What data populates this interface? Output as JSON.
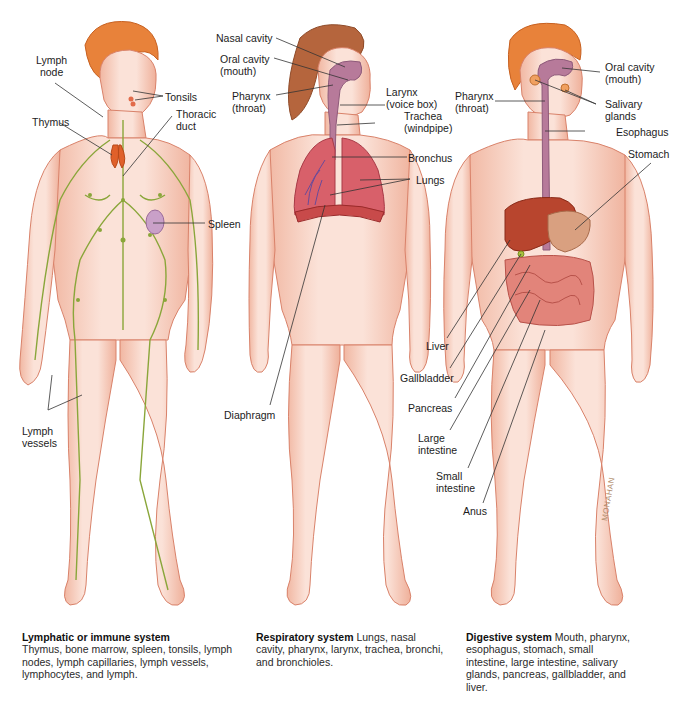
{
  "figures": {
    "lymphatic": {
      "labels": {
        "lymph_node": "Lymph\nnode",
        "tonsils": "Tonsils",
        "thymus": "Thymus",
        "thoracic_duct": "Thoracic\nduct",
        "spleen": "Spleen",
        "lymph_vessels": "Lymph\nvessels"
      },
      "caption": {
        "title": "Lymphatic or immune system",
        "body": "Thymus, bone marrow, spleen, tonsils, lymph nodes, lymph capillaries, lymph vessels, lymphocytes, and lymph."
      }
    },
    "respiratory": {
      "labels": {
        "nasal_cavity": "Nasal cavity",
        "oral_cavity": "Oral cavity\n(mouth)",
        "pharynx": "Pharynx\n(throat)",
        "larynx": "Larynx\n(voice box)",
        "trachea": "Trachea\n(windpipe)",
        "bronchus": "Bronchus",
        "lungs": "Lungs",
        "diaphragm": "Diaphragm"
      },
      "caption": {
        "title": "Respiratory system",
        "body": " Lungs, nasal cavity, pharynx, larynx, trachea, bronchi, and bronchioles."
      }
    },
    "digestive": {
      "labels": {
        "oral_cavity": "Oral cavity\n(mouth)",
        "pharynx": "Pharynx\n(throat)",
        "salivary_glands": "Salivary\nglands",
        "esophagus": "Esophagus",
        "stomach": "Stomach",
        "liver": "Liver",
        "gallbladder": "Gallbladder",
        "pancreas": "Pancreas",
        "large_intestine": "Large\nintestine",
        "small_intestine": "Small\nintestine",
        "anus": "Anus"
      },
      "caption": {
        "title": "Digestive system",
        "body": " Mouth, pharynx, esophagus, stomach, small intestine, large intestine, salivary glands, pancreas, gallbladder, and liver."
      }
    }
  },
  "signature": "MONAHAN",
  "colors": {
    "skin": "#f7d3c4",
    "skin_edge": "#d9826a",
    "hair_orange": "#e8823a",
    "hair_brown": "#b5653d",
    "lymph_green": "#8aa63a",
    "lung_red": "#d8606a",
    "airway_purple": "#b77a9a",
    "liver": "#b8452e",
    "intestine": "#e2847a"
  }
}
